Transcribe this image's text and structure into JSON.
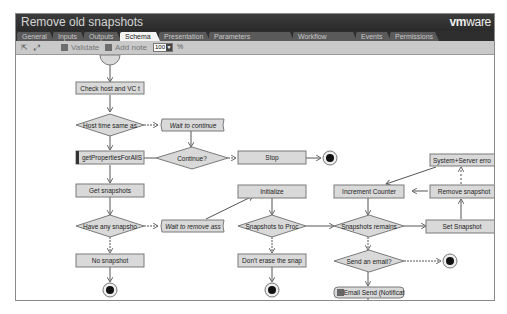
{
  "window": {
    "title": "Remove old snapshots",
    "brand_bold": "vm",
    "brand_rest": "ware"
  },
  "tabs": [
    {
      "label": "General",
      "active": false
    },
    {
      "label": "Inputs",
      "active": false
    },
    {
      "label": "Outputs",
      "active": false
    },
    {
      "label": "Schema",
      "active": true
    },
    {
      "label": "Presentation",
      "active": false
    },
    {
      "label": "Parameters References",
      "active": false
    },
    {
      "label": "Workflow Tokens",
      "active": false
    },
    {
      "label": "Events",
      "active": false
    },
    {
      "label": "Permissions",
      "active": false
    }
  ],
  "toolbar": {
    "validate_label": "Validate",
    "add_note_label": "Add note",
    "zoom_value": "100",
    "zoom_unit": "%",
    "icons": [
      "fit-icon",
      "zoom-icon"
    ]
  },
  "schema": {
    "nodes": {
      "check_host": "Check host and VC t",
      "host_time_same": "Host time same as",
      "wait_continue": "Wait to continue",
      "continue": "Continue?",
      "stop": "Stop",
      "get_props": "getPropertiesForAllS",
      "get_snapshots": "Get snapshots",
      "initialize": "Initialize",
      "increment_counter": "Increment Counter",
      "remove_snapshot": "Remove snapshot",
      "system_server_error": "System+Server erro",
      "have_any_snapshot": "Have any snapsho",
      "wait_remove": "Wait to remove ass",
      "snapshots_to_proc": "Snapshots to Proc",
      "snapshots_remains": "Snapshots remains",
      "set_snapshot": "Set Snapshot",
      "no_snapshot": "No snapshot",
      "dont_erase": "Don't erase the snap",
      "send_email": "Send an email?",
      "email_send": "Email Send (Notificat"
    }
  },
  "colors": {
    "titlebar": "#333333",
    "tab_inactive": "#5a5a5a",
    "tab_active": "#f4f4f4",
    "toolbar": "#c9c9c9",
    "node_fill": "#d9d9d9",
    "node_stroke": "#7a7a7a",
    "connector": "#555555"
  }
}
